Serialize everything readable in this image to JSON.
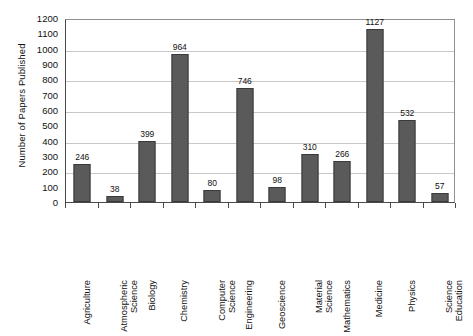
{
  "chart_data": {
    "type": "bar",
    "title": "",
    "xlabel": "",
    "ylabel": "Number of Papers Published",
    "ylim": [
      0,
      1200
    ],
    "ytick_step": 100,
    "gridline_step": 200,
    "grid": true,
    "legend": "none",
    "bar_color": "#5a5a5a",
    "categories": [
      "Agriculture",
      "Atmospheric Science",
      "Biology",
      "Chemistry",
      "Computer Science",
      "Engineering",
      "Geoscience",
      "Material Science",
      "Mathematics",
      "Medicine",
      "Physics",
      "Science Education"
    ],
    "category_lines": [
      [
        "Agriculture"
      ],
      [
        "Atmospheric",
        "Science"
      ],
      [
        "Biology"
      ],
      [
        "Chemistry"
      ],
      [
        "Computer",
        "Science"
      ],
      [
        "Engineering"
      ],
      [
        "Geoscience"
      ],
      [
        "Material",
        "Science"
      ],
      [
        "Mathematics"
      ],
      [
        "Medicine"
      ],
      [
        "Physics"
      ],
      [
        "Science",
        "Education"
      ]
    ],
    "values": [
      246,
      38,
      399,
      964,
      80,
      746,
      98,
      310,
      266,
      1127,
      532,
      57
    ],
    "yticks": [
      1200,
      1100,
      1000,
      900,
      800,
      700,
      600,
      500,
      400,
      300,
      200,
      100,
      0
    ]
  }
}
